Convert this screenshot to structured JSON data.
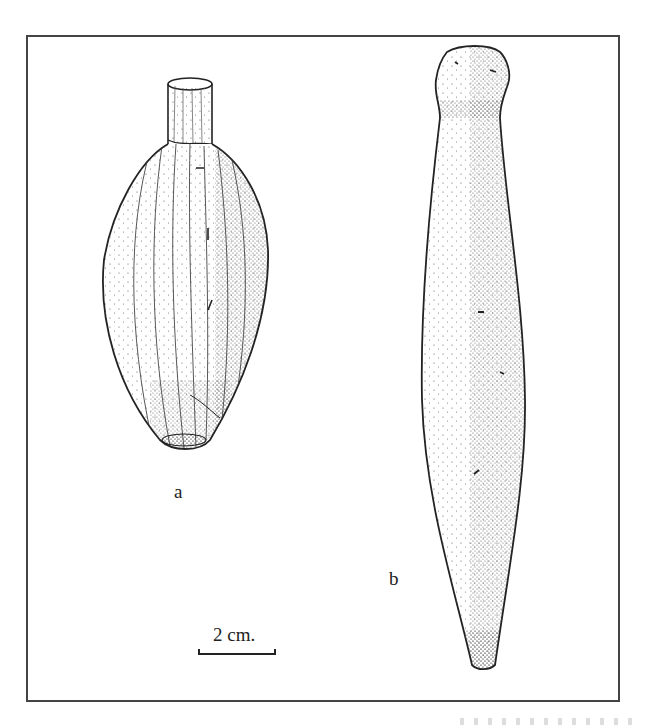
{
  "figure": {
    "type": "archaeological line drawing (stippled)",
    "frame": {
      "border_color": "#444444"
    },
    "objects": [
      {
        "id": "a",
        "label": "a",
        "description": "Pear/lemon-shaped vessel with a short cylindrical neck, vertical striations, stippled shading on right side"
      },
      {
        "id": "b",
        "label": "b",
        "description": "Elongated spindle/club-shaped object with knobbed head, heavily stippled, tapering to point at bottom"
      }
    ],
    "scale_bar": {
      "label": "2 cm."
    },
    "ink_color": "#222222"
  }
}
